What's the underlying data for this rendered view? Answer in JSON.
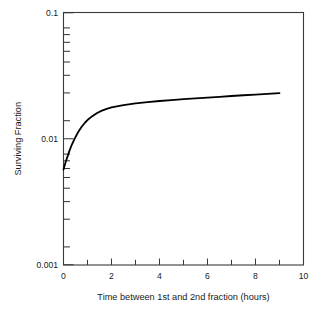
{
  "chart_data": {
    "type": "line",
    "title": "",
    "subtitle": "",
    "xlabel": "Time between 1st and 2nd fraction (hours)",
    "ylabel": "Surviving Fraction",
    "xscale": "linear",
    "yscale": "log",
    "xlim": [
      0,
      10
    ],
    "ylim": [
      0.001,
      0.1
    ],
    "grid": false,
    "legend": null,
    "x_major_ticks": [
      0,
      2,
      4,
      6,
      8,
      10
    ],
    "x_major_tick_labels": [
      "0",
      "2",
      "4",
      "6",
      "8",
      "10"
    ],
    "x_minor_ticks": [
      1,
      3,
      5,
      7,
      9
    ],
    "y_major_ticks": [
      0.001,
      0.01,
      0.1
    ],
    "y_major_tick_labels": [
      "0.001",
      "0.01",
      "0.1"
    ],
    "y_minor_ticks": [
      0.002,
      0.003,
      0.004,
      0.005,
      0.006,
      0.007,
      0.008,
      0.009,
      0.02,
      0.03,
      0.04,
      0.05,
      0.06,
      0.07,
      0.08,
      0.09
    ],
    "series": [
      {
        "name": "Surviving fraction vs interfraction interval",
        "color": "#000000",
        "line_width": 1.8,
        "x": [
          0.0,
          0.08,
          0.17,
          0.25,
          0.35,
          0.45,
          0.6,
          0.75,
          0.9,
          1.05,
          1.2,
          1.4,
          1.6,
          1.8,
          2.0,
          2.5,
          3.0,
          3.5,
          4.0,
          4.5,
          5.0,
          5.5,
          6.0,
          6.5,
          7.0,
          7.5,
          8.0,
          8.5,
          9.0
        ],
        "y": [
          0.0057,
          0.00645,
          0.00725,
          0.00805,
          0.009,
          0.0099,
          0.0112,
          0.0124,
          0.01345,
          0.01435,
          0.0151,
          0.016,
          0.0167,
          0.01725,
          0.0177,
          0.0185,
          0.01905,
          0.0195,
          0.0199,
          0.02025,
          0.0206,
          0.0209,
          0.0212,
          0.0215,
          0.0218,
          0.0221,
          0.0224,
          0.0227,
          0.023
        ]
      }
    ]
  },
  "axes": {
    "y_label_text": "Surviving Fraction",
    "x_label_text": "Time between 1st and 2nd fraction (hours)",
    "y_tick_top": "0.1",
    "y_tick_mid": "0.01",
    "y_tick_bottom": "0.001",
    "x_tick_0": "0",
    "x_tick_2": "2",
    "x_tick_4": "4",
    "x_tick_6": "6",
    "x_tick_8": "8",
    "x_tick_10": "10"
  },
  "colors": {
    "background": "#ffffff",
    "frame": "#3a3a3a",
    "curve": "#000000",
    "text": "#1a1a1a"
  }
}
